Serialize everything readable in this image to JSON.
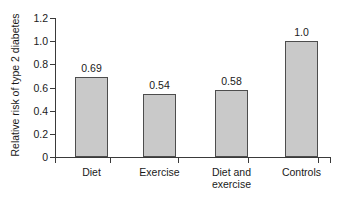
{
  "chart_data": {
    "type": "bar",
    "title": "",
    "xlabel": "",
    "ylabel": "Relative risk of type 2 diabetes",
    "categories": [
      "Diet",
      "Exercise",
      "Diet and\nexercise",
      "Controls"
    ],
    "values": [
      0.69,
      0.54,
      0.58,
      1.0
    ],
    "value_labels": [
      "0.69",
      "0.54",
      "0.58",
      "1.0"
    ],
    "ylim": [
      0,
      1.2
    ],
    "yticks": [
      0,
      0.2,
      0.4,
      0.6,
      0.8,
      1.0,
      1.2
    ],
    "ytick_labels": [
      "0",
      "0.2",
      "0.4",
      "0.6",
      "0.8",
      "1.0",
      "1.2"
    ],
    "grid": false,
    "legend": null,
    "bar_fill_color": "#c9c9c9",
    "bar_edge_color": "#4d4d4d",
    "axis_color": "#3a3a3a",
    "background_color": "#ffffff"
  }
}
